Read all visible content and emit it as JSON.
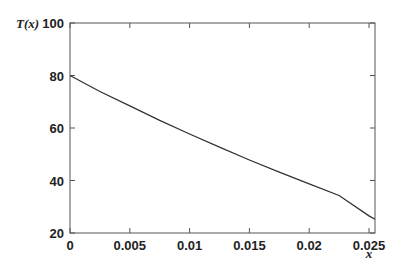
{
  "chart_data": {
    "type": "line",
    "title": "",
    "xlabel": "x",
    "ylabel": "T(x)",
    "xlim": [
      0,
      0.0255
    ],
    "ylim": [
      20,
      100
    ],
    "xticks": [
      0,
      0.005,
      0.01,
      0.015,
      0.02,
      0.025
    ],
    "xtick_labels": [
      "0",
      "0.005",
      "0.01",
      "0.015",
      "0.02",
      "0.025"
    ],
    "yticks": [
      20,
      40,
      60,
      80,
      100
    ],
    "ytick_labels": [
      "20",
      "40",
      "60",
      "80",
      "100"
    ],
    "grid": false,
    "legend": null,
    "series": [
      {
        "name": "T(x)",
        "color": "#333333",
        "x": [
          0,
          0.0025,
          0.005,
          0.0075,
          0.01,
          0.0125,
          0.015,
          0.0175,
          0.02,
          0.0225,
          0.025,
          0.0255
        ],
        "y": [
          80,
          73.9,
          68.4,
          62.9,
          57.7,
          52.7,
          47.8,
          43.2,
          38.7,
          34.3,
          26.5,
          25.2
        ]
      }
    ]
  },
  "axes": {
    "xlabel": "x",
    "ylabel": "T(x)"
  }
}
